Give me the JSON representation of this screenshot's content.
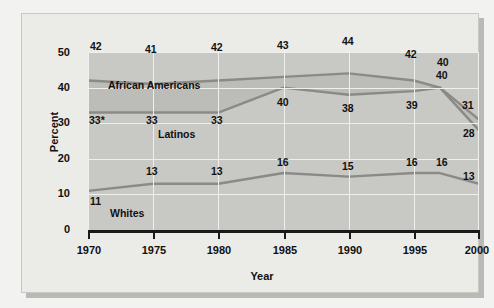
{
  "chart_data": {
    "type": "line",
    "title": "",
    "xlabel": "Year",
    "ylabel": "Percent",
    "xlim": [
      1970,
      2000
    ],
    "ylim": [
      0,
      50
    ],
    "grid": true,
    "legend_position": "inline-annotations",
    "x_ticks": [
      "1970",
      "1975",
      "1980",
      "1985",
      "1990",
      "1995",
      "2000"
    ],
    "y_ticks": [
      "0",
      "10",
      "20",
      "30",
      "40",
      "50"
    ],
    "x": [
      1970,
      1975,
      1980,
      1985,
      1990,
      1995,
      1997,
      2000
    ],
    "series": [
      {
        "name": "African Americans",
        "color": "#8a8a86",
        "values": [
          42,
          41,
          42,
          43,
          44,
          42,
          40,
          31
        ],
        "point_labels": [
          "42",
          "41",
          "42",
          "43",
          "44",
          "42",
          "40",
          "31"
        ]
      },
      {
        "name": "Latinos",
        "color": "#8a8a86",
        "values": [
          33,
          33,
          33,
          40,
          38,
          39,
          40,
          28
        ],
        "point_labels": [
          "33*",
          "33",
          "33",
          "40",
          "38",
          "39",
          "40",
          "28"
        ]
      },
      {
        "name": "Whites",
        "color": "#8a8a86",
        "values": [
          11,
          13,
          13,
          16,
          15,
          16,
          16,
          13
        ],
        "point_labels": [
          "11",
          "13",
          "13",
          "16",
          "15",
          "16",
          "16",
          "13"
        ]
      }
    ],
    "annotations": [
      {
        "text": "African Americans",
        "x": 1975.2,
        "y": 38.0
      },
      {
        "text": "Latinos",
        "x": 1979.1,
        "y": 26.5
      },
      {
        "text": "Whites",
        "x": 1972.6,
        "y": 6.2
      }
    ],
    "colors": {
      "panel": "#c8c8c4",
      "band": "#bcbcb8",
      "grid": "#efefed",
      "line": "#8a8a86",
      "axis": "#1a1a1a",
      "card": "#ebebe8",
      "text": "#111111"
    },
    "footnote_marker": "*"
  }
}
